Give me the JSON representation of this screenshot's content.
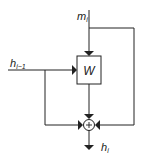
{
  "diagram": {
    "inputs": {
      "top": {
        "label": "m",
        "subscript": "i"
      },
      "left": {
        "label": "h",
        "subscript": "i−1"
      }
    },
    "block": {
      "label": "W"
    },
    "sum_node": {
      "symbol": "+"
    },
    "output": {
      "label": "h",
      "subscript": "i"
    },
    "colors": {
      "stroke": "#222222",
      "box_fill": "#ffffff",
      "background": "#ffffff"
    }
  }
}
